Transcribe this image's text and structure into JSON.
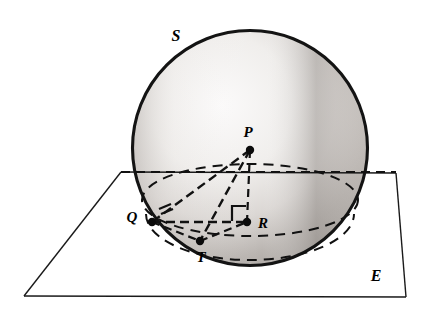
{
  "figure": {
    "background_color": "#ffffff",
    "ink_color": "#111111"
  },
  "labels": {
    "sphere": "S",
    "center": "P",
    "tangent_point": "Q",
    "foot_point": "T",
    "right_angle_vertex": "R",
    "plane": "E"
  },
  "label_positions": {
    "sphere": {
      "x": 176,
      "y": 41
    },
    "center": {
      "x": 248,
      "y": 137
    },
    "tangent_point": {
      "x": 132,
      "y": 222
    },
    "foot_point": {
      "x": 201,
      "y": 262
    },
    "right_angle_vertex": {
      "x": 263,
      "y": 228
    },
    "plane": {
      "x": 376,
      "y": 281
    }
  },
  "points": {
    "P": {
      "x": 250,
      "y": 150
    },
    "Q": {
      "x": 152,
      "y": 222
    },
    "T": {
      "x": 200,
      "y": 241
    },
    "R": {
      "x": 247,
      "y": 222
    }
  },
  "sphere_geometry": {
    "center_x": 250,
    "center_y": 148,
    "radius": 118,
    "outline_color": "#141414",
    "fill_light": "#f4f2f0",
    "fill_shadow": "#a9a5a2"
  },
  "plane_geometry": {
    "corners": [
      {
        "x": 121,
        "y": 172
      },
      {
        "x": 396,
        "y": 173
      },
      {
        "x": 406,
        "y": 297
      },
      {
        "x": 24,
        "y": 296
      }
    ],
    "outline_color": "#1a1a1a"
  },
  "intersection_ellipse": {
    "center_x": 250,
    "center_y": 200,
    "rx": 108,
    "ry": 36,
    "style": "dashed"
  },
  "lower_hidden_arc": {
    "center_x": 250,
    "center_y": 215,
    "rx": 104,
    "ry": 46,
    "style": "dashed"
  },
  "segments": [
    {
      "name": "P-Q",
      "from": "P",
      "to": "Q",
      "style": "dashed"
    },
    {
      "name": "P-T",
      "from": "P",
      "to": "T",
      "style": "dashed"
    },
    {
      "name": "P-R",
      "from": "P",
      "to": "R",
      "style": "dashed"
    },
    {
      "name": "Q-R",
      "from": "Q",
      "to": "R",
      "style": "dashed"
    },
    {
      "name": "Q-T",
      "from": "Q",
      "to": "T",
      "style": "dashed"
    },
    {
      "name": "T-R",
      "from": "T",
      "to": "R",
      "style": "dashed"
    }
  ],
  "horizontal_guide_line": {
    "x1": 121,
    "y1": 172,
    "x2": 396,
    "y2": 172,
    "style": "dashed"
  },
  "markers": {
    "right_angle_at": "R",
    "tick_marks_at": "Q",
    "tick_mark_count": 2
  }
}
